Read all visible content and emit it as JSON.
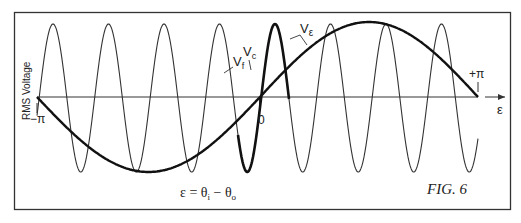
{
  "figure": {
    "caption": "FIG. 6",
    "y_axis_label": "RMS Voltage",
    "x_axis_label": "ε",
    "tick_left": "−π",
    "tick_center": "0",
    "tick_right": "+π",
    "equation": {
      "lhs": "ε = θ",
      "sub1": "i",
      "minus": " − θ",
      "sub2": "o"
    },
    "curve_labels": {
      "vf": "V",
      "vf_sub": "f",
      "vc": "V",
      "vc_sub": "c",
      "ve": "V",
      "ve_sub": "ε"
    }
  },
  "chart_data": {
    "type": "line",
    "title": "FIG. 6",
    "xlabel": "ε = θi − θo",
    "ylabel": "RMS Voltage",
    "x_ticks": [
      "−π",
      "0",
      "+π"
    ],
    "xlim": [
      "-π",
      "+π"
    ],
    "grid": false,
    "series": [
      {
        "name": "Vf",
        "description": "high-frequency oscillation of constant amplitude, ~8 cycles across −π..+π",
        "style": "thin"
      },
      {
        "name": "Vc",
        "description": "single cycle of Vf around ε = 0 drawn bold",
        "style": "bold"
      },
      {
        "name": "Vε",
        "description": "single sine cycle: 0 at −π, minimum near −π/2, 0 at 0, maximum near +π/2, 0 at +π",
        "style": "bold"
      }
    ]
  }
}
